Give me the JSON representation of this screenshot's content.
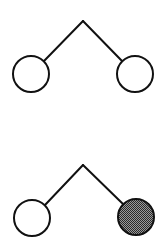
{
  "diagrams": [
    {
      "name": "tree-unfilled",
      "apex": [
        83,
        21
      ],
      "left_node": {
        "cx": 31,
        "cy": 74,
        "r": 18,
        "filled": false
      },
      "right_node": {
        "cx": 135,
        "cy": 74,
        "r": 18,
        "filled": false
      }
    },
    {
      "name": "tree-right-filled",
      "apex": [
        83,
        165
      ],
      "left_node": {
        "cx": 32,
        "cy": 218,
        "r": 18,
        "filled": false
      },
      "right_node": {
        "cx": 136,
        "cy": 217,
        "r": 18,
        "filled": true
      }
    }
  ],
  "colors": {
    "stroke": "#111111",
    "empty_fill": "#ffffff",
    "shaded_fill": "#5a5a5a",
    "background": "#ffffff"
  }
}
